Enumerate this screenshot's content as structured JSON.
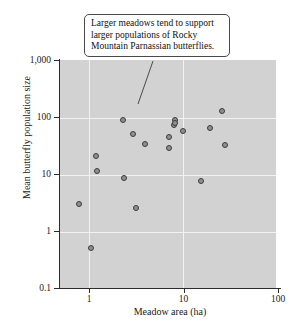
{
  "figure": {
    "callout_text": "Larger meadows tend to support larger populations of Rocky Mountain Parnassian butterflies."
  },
  "colors": {
    "plot_background": "#d2d2d2",
    "gridline": "#f2f2f2",
    "axis": "#2b2b2b",
    "marker_fill": "#8f8f8f",
    "marker_edge": "#3c3c3c",
    "callout_background": "#ffffff",
    "callout_border": "#4a4a4a",
    "page_background": "#ffffff"
  },
  "chart_data": {
    "type": "scatter",
    "title": "",
    "xlabel": "Meadow area (ha)",
    "ylabel": "Mean butterfly population size",
    "xscale": "log",
    "yscale": "log",
    "xlim": [
      0.5,
      100
    ],
    "ylim": [
      0.1,
      1000
    ],
    "grid": true,
    "legend": "none",
    "xticks": [
      1,
      10,
      100
    ],
    "xtick_labels": [
      "1",
      "10",
      "100"
    ],
    "yticks": [
      0.1,
      1,
      10,
      100,
      1000
    ],
    "ytick_labels": [
      "0.1",
      "1",
      "10",
      "100",
      "1,000"
    ],
    "annotations": [
      {
        "text": "Larger meadows tend to support larger populations of Rocky Mountain Parnassian butterflies.",
        "points_to_x": 2.3,
        "points_to_y": 120
      }
    ],
    "points": [
      {
        "x": 0.78,
        "y": 3.0
      },
      {
        "x": 1.05,
        "y": 0.5
      },
      {
        "x": 1.2,
        "y": 21
      },
      {
        "x": 1.22,
        "y": 11.5
      },
      {
        "x": 2.3,
        "y": 88
      },
      {
        "x": 2.35,
        "y": 8.6
      },
      {
        "x": 2.9,
        "y": 50
      },
      {
        "x": 3.15,
        "y": 2.5
      },
      {
        "x": 3.9,
        "y": 34
      },
      {
        "x": 7.0,
        "y": 45
      },
      {
        "x": 7.1,
        "y": 29
      },
      {
        "x": 7.9,
        "y": 72
      },
      {
        "x": 8.1,
        "y": 88
      },
      {
        "x": 8.2,
        "y": 80
      },
      {
        "x": 9.8,
        "y": 56
      },
      {
        "x": 15.5,
        "y": 7.5
      },
      {
        "x": 19.0,
        "y": 63
      },
      {
        "x": 25.5,
        "y": 128
      },
      {
        "x": 27.5,
        "y": 32
      }
    ]
  }
}
